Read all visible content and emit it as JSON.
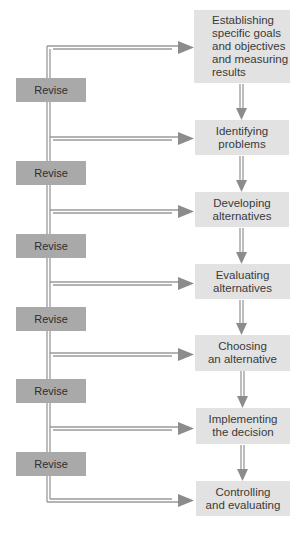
{
  "diagram": {
    "type": "decision-making process flowchart",
    "steps": [
      {
        "label": "Establishing\nspecific goals\nand objectives\nand measuring\nresults"
      },
      {
        "label": "Identifying\nproblems"
      },
      {
        "label": "Developing\nalternatives"
      },
      {
        "label": "Evaluating\nalternatives"
      },
      {
        "label": "Choosing\nan alternative"
      },
      {
        "label": "Implementing\nthe decision"
      },
      {
        "label": "Controlling\nand evaluating"
      }
    ],
    "revise_boxes": [
      {
        "label": "Revise"
      },
      {
        "label": "Revise"
      },
      {
        "label": "Revise"
      },
      {
        "label": "Revise"
      },
      {
        "label": "Revise"
      },
      {
        "label": "Revise"
      }
    ],
    "colors": {
      "step_fill": "#e2e2e2",
      "revise_fill": "#a9a9a9",
      "line": "#8c8c8c"
    }
  }
}
